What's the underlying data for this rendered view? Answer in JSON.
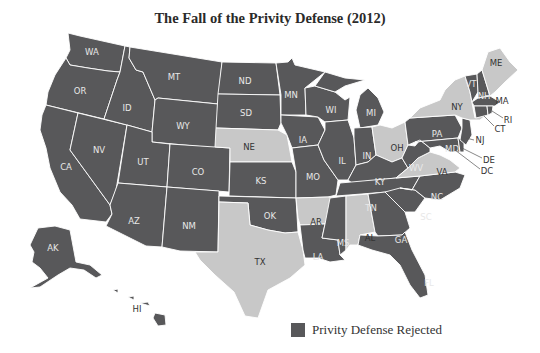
{
  "title": "The Fall of the Privity Defense (2012)",
  "legend": {
    "items": [
      {
        "label": "Privity Defense Rejected",
        "color": "#58585a"
      }
    ]
  },
  "colors": {
    "rejected": "#58585a",
    "not_rejected": "#c8c8c8",
    "border": "#ffffff",
    "background": "#ffffff"
  },
  "states": {
    "rejected": [
      "WA",
      "OR",
      "CA",
      "ID",
      "NV",
      "MT",
      "WY",
      "UT",
      "AZ",
      "CO",
      "NM",
      "ND",
      "SD",
      "KS",
      "OK",
      "MN",
      "IA",
      "MO",
      "LA",
      "WI",
      "IL",
      "MI",
      "IN",
      "KY",
      "TN",
      "MS",
      "GA",
      "FL",
      "SC",
      "NC",
      "WV",
      "PA",
      "NJ",
      "MD",
      "DE",
      "DC",
      "VT",
      "NH",
      "MA",
      "CT",
      "RI",
      "AK",
      "HI"
    ],
    "not_rejected": [
      "NE",
      "TX",
      "AR",
      "AL",
      "OH",
      "NY",
      "VA",
      "ME"
    ]
  },
  "labels": {
    "WA": "WA",
    "OR": "OR",
    "CA": "CA",
    "ID": "ID",
    "NV": "NV",
    "MT": "MT",
    "WY": "WY",
    "UT": "UT",
    "AZ": "AZ",
    "CO": "CO",
    "NM": "NM",
    "ND": "ND",
    "SD": "SD",
    "NE": "NE",
    "KS": "KS",
    "OK": "OK",
    "TX": "TX",
    "MN": "MN",
    "IA": "IA",
    "MO": "MO",
    "AR": "AR",
    "LA": "LA",
    "WI": "WI",
    "IL": "IL",
    "MI": "MI",
    "IN": "IN",
    "OH": "OH",
    "KY": "KY",
    "TN": "TN",
    "MS": "MS",
    "AL": "AL",
    "GA": "GA",
    "FL": "FL",
    "SC": "SC",
    "NC": "NC",
    "VA": "VA",
    "WV": "WV",
    "PA": "PA",
    "NY": "NY",
    "NJ": "NJ",
    "MD": "MD",
    "DE": "DE",
    "DC": "DC",
    "VT": "VT",
    "NH": "NH",
    "ME": "ME",
    "MA": "MA",
    "CT": "CT",
    "RI": "RI",
    "AK": "AK",
    "HI": "HI"
  }
}
